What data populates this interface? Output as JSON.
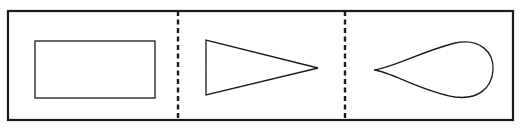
{
  "diagram": {
    "title": "",
    "colors": {
      "background": "#ffffff",
      "stroke": "#1a1a1a"
    },
    "frame": {
      "x": 8,
      "y": 11,
      "width": 505,
      "height": 109,
      "stroke_width": 2.2
    },
    "dividers": [
      {
        "x": 178,
        "y1": 11,
        "y2": 120,
        "style": "dashed"
      },
      {
        "x": 345,
        "y1": 11,
        "y2": 120,
        "style": "dashed"
      }
    ],
    "panels": [
      {
        "index": 1,
        "shape": "rectangle",
        "label": ""
      },
      {
        "index": 2,
        "shape": "triangle",
        "label": ""
      },
      {
        "index": 3,
        "shape": "teardrop",
        "label": ""
      }
    ],
    "shapes": {
      "rectangle": {
        "x": 35,
        "y": 41,
        "width": 120,
        "height": 57
      },
      "triangle": {
        "points": "206,40 206,95 318,68"
      },
      "teardrop": {
        "path": "M374,70 C392,68 420,52 455,43 C480,38 494,52 493,70 C492,88 478,100 455,97 C420,91 392,72 374,70 Z"
      }
    }
  }
}
